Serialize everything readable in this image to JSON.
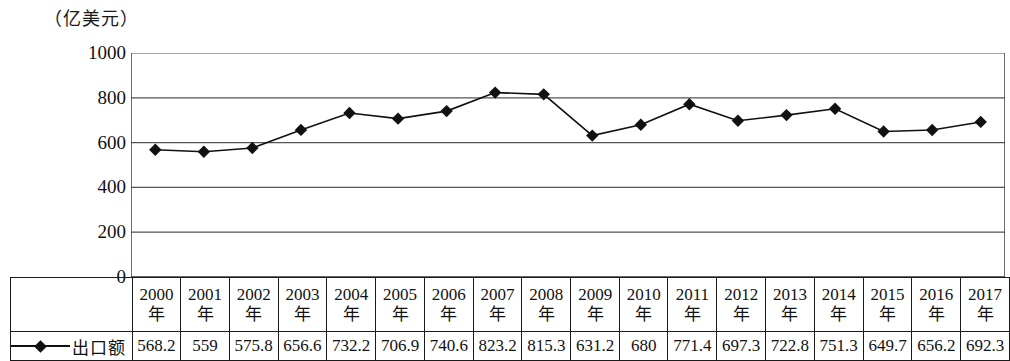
{
  "unit_title": "（亿美元）",
  "legend": {
    "label": "出口额",
    "marker": "diamond-line-marker"
  },
  "y_axis": {
    "ticks": [
      "0",
      "200",
      "400",
      "600",
      "800",
      "1000"
    ],
    "min": 0,
    "max": 1000
  },
  "year_suffix": "年",
  "chart_data": {
    "type": "line",
    "title": "（亿美元）",
    "xlabel": "",
    "ylabel": "亿美元",
    "ylim": [
      0,
      1000
    ],
    "yticks": [
      0,
      200,
      400,
      600,
      800,
      1000
    ],
    "grid": true,
    "legend_position": "bottom-left",
    "categories": [
      "2000年",
      "2001年",
      "2002年",
      "2003年",
      "2004年",
      "2005年",
      "2006年",
      "2007年",
      "2008年",
      "2009年",
      "2010年",
      "2011年",
      "2012年",
      "2013年",
      "2014年",
      "2015年",
      "2016年",
      "2017年"
    ],
    "series": [
      {
        "name": "出口额",
        "marker": "diamond",
        "color": "#111111",
        "values": [
          568.2,
          559,
          575.8,
          656.6,
          732.2,
          706.9,
          740.6,
          823.2,
          815.3,
          631.2,
          680,
          771.4,
          697.3,
          722.8,
          751.3,
          649.7,
          656.2,
          692.3
        ],
        "value_labels": [
          "568.2",
          "559",
          "575.8",
          "656.6",
          "732.2",
          "706.9",
          "740.6",
          "823.2",
          "815.3",
          "631.2",
          "680",
          "771.4",
          "697.3",
          "722.8",
          "751.3",
          "649.7",
          "656.2",
          "692.3"
        ]
      }
    ]
  },
  "colors": {
    "line": "#111111",
    "marker": "#111111",
    "grid": "#555555",
    "axis": "#333333",
    "table_border": "#1a1a1a"
  }
}
